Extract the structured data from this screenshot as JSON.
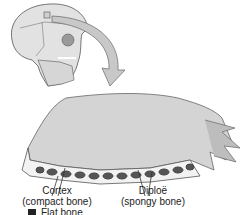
{
  "figure": {
    "labels": {
      "cortex": {
        "title": "Cortex",
        "subtitle": "(compact bone)"
      },
      "diploe": {
        "title": "Diploë",
        "subtitle": "(spongy bone)"
      }
    },
    "caption": {
      "text": "Flat bone"
    },
    "colors": {
      "bone_surface": "#d4d4d4",
      "bone_shadow": "#9a9a9a",
      "arrow_fill": "#c8c8c8",
      "text": "#222222"
    }
  }
}
